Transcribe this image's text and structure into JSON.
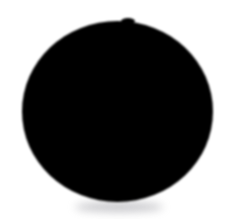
{
  "image": {
    "title": "Solid black circle on white background",
    "description": "A single large solid black filled disc, roughly centered, on a plain white background. Edges are softly anti-aliased and a faint gray blur sits just below the lower arc.",
    "alt_text": "Black circle",
    "width": 233,
    "height": 219,
    "background_color": "#ffffff"
  },
  "shapes": {
    "disc": {
      "name": "black-circle",
      "type": "ellipse",
      "fill_color": "#000000",
      "center_x": 117.5,
      "center_y": 111.5,
      "radius_x": 95.5,
      "radius_y": 90.5,
      "bounds": {
        "left": 22,
        "top": 21,
        "right": 213,
        "bottom": 202,
        "width": 191,
        "height": 181
      },
      "edge_softness_px": 1.6
    },
    "notch": {
      "name": "top-edge-notch",
      "type": "bump",
      "fill_color": "#000000",
      "center_x": 128,
      "center_y": 21,
      "radius_x": 7,
      "radius_y": 3
    },
    "shadow": {
      "name": "bottom-shadow-smudge",
      "type": "blurred-ellipse",
      "fill_color": "#9a9aa0",
      "opacity": 0.55,
      "center_x": 119,
      "center_y": 207,
      "radius_x": 44,
      "radius_y": 5,
      "blur_px": 4
    }
  }
}
